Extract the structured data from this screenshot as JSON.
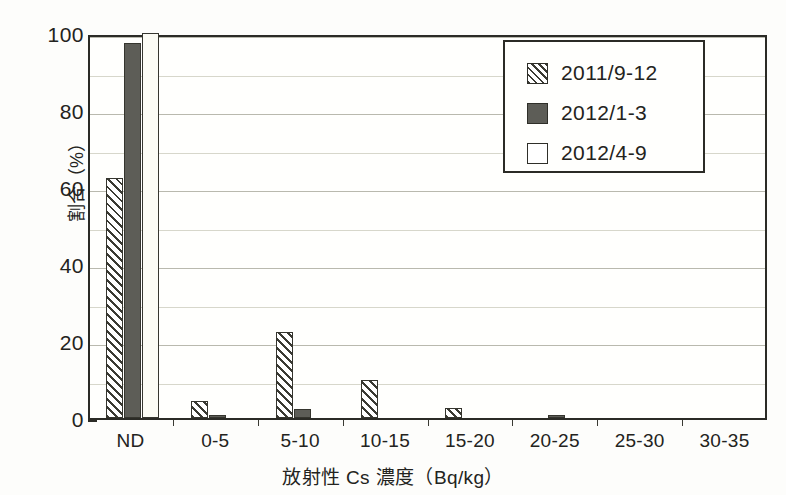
{
  "chart_data": {
    "type": "bar",
    "title": "",
    "xlabel": "放射性 Cs 濃度（Bq/kg）",
    "ylabel": "割合（%）",
    "ylim": [
      0,
      100
    ],
    "yticks": [
      0,
      20,
      40,
      60,
      80,
      100
    ],
    "ytick_labels": [
      "0",
      "20",
      "40",
      "60",
      "80",
      "100"
    ],
    "minor_ytick_step": 10,
    "grid": true,
    "grid_axis": "y",
    "grid_step": 10,
    "legend_position": "upper right",
    "categories": [
      "ND",
      "0-5",
      "5-10",
      "10-15",
      "15-20",
      "20-25",
      "25-30",
      "30-35"
    ],
    "series": [
      {
        "name": "2011/9-12",
        "fill": "hatched",
        "values": [
          62.3,
          4.3,
          22.4,
          10.0,
          2.5,
          0.0,
          0.0,
          0.0
        ]
      },
      {
        "name": "2012/1-3",
        "fill": "dark-gray",
        "values": [
          97.5,
          0.8,
          2.3,
          0.0,
          0.0,
          0.8,
          0.0,
          0.0
        ]
      },
      {
        "name": "2012/4-9",
        "fill": "white",
        "values": [
          100.0,
          0.0,
          0.0,
          0.0,
          0.0,
          0.0,
          0.0,
          0.0
        ]
      }
    ]
  },
  "colors": {
    "series_hatched_line": "#3a3a33",
    "series_dark": "#5d5d57",
    "series_white": "#ffffff",
    "axis": "#2b2b26",
    "grid": "#b9b9ae",
    "text": "#232320",
    "background": "#fdfdfb"
  }
}
